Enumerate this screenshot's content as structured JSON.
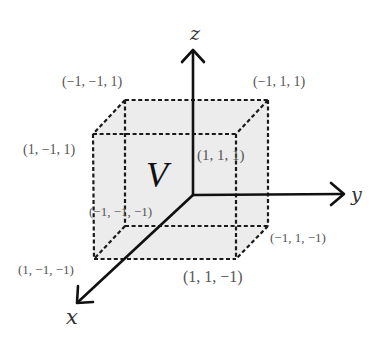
{
  "diagram": {
    "title_symbol": "V",
    "colors": {
      "cube_fill": "#ececec",
      "edge": "#1a1a1a",
      "axis": "#111111",
      "vertex_label": "#555555",
      "axis_label": "#333333"
    },
    "axes": {
      "x": {
        "label": "x"
      },
      "y": {
        "label": "y"
      },
      "z": {
        "label": "z"
      }
    },
    "vertices": [
      {
        "id": "v_m1_m1_1",
        "label": "(−1, −1, 1)"
      },
      {
        "id": "v_m1_1_1",
        "label": "(−1, 1, 1)"
      },
      {
        "id": "v_1_m1_1",
        "label": "(1, −1, 1)"
      },
      {
        "id": "v_1_1_1",
        "label": "(1, 1, 1)"
      },
      {
        "id": "v_m1_m1_m1",
        "label": "(−1, −1, −1)"
      },
      {
        "id": "v_m1_1_m1",
        "label": "(−1, 1, −1)"
      },
      {
        "id": "v_1_m1_m1",
        "label": "(1, −1, −1)"
      },
      {
        "id": "v_1_1_m1",
        "label": "(1, 1, −1)"
      }
    ]
  }
}
